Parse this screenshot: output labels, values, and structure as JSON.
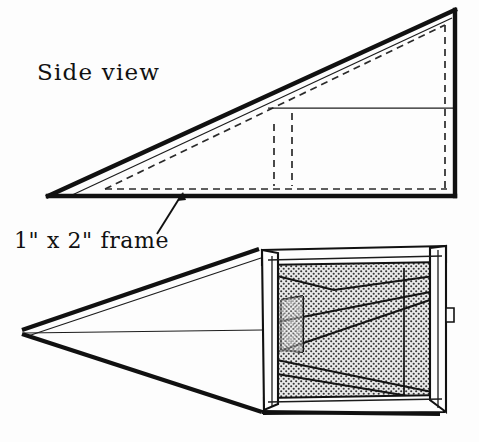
{
  "document": {
    "kind": "technical-line-drawing",
    "medium": "scanned hand-lettered ink drawing",
    "background_color": "#fdfdfd",
    "ink_color": "#111111",
    "subject": "Wedge-shaped screened frame box shown in side view and perspective view"
  },
  "labels": {
    "side_view": "Side view",
    "frame_callout": "1\" x 2\" frame"
  },
  "colors": {
    "paper": "#fdfdfd",
    "ink": "#111111",
    "ink_light": "#2a2a2a",
    "hidden_line": "#2b2b2b",
    "mesh_dot": "#3a3a3a",
    "mesh_fill": "#e8e8e8"
  },
  "views": {
    "side_view": {
      "name": "Side view",
      "description": "Right triangle profile with thick outer rule, thin inner parallel rule, dashed hidden interior frame members, and a horizontal shelf line at mid-height",
      "apex_left": [
        48,
        196
      ],
      "apex_top_right": [
        455,
        10
      ],
      "corner_bottom_right": [
        455,
        196
      ],
      "has_hidden_dashed_lines": true,
      "has_mid_horizontal_line": true
    },
    "perspective_view": {
      "name": "Perspective view",
      "description": "Wedge box receding to a sharp point at left, open screened end at right filled with stippled mesh and internal 1x2 frame members",
      "apex_left": [
        22,
        333
      ],
      "opening_top_left": [
        258,
        250
      ],
      "opening_bottom_right": [
        447,
        412
      ],
      "mesh_texture": "stipple-dot screen",
      "has_internal_frame_members": true
    }
  },
  "callout": {
    "text": "1\" x 2\" frame",
    "leader_from": [
      158,
      233
    ],
    "leader_to": [
      183,
      193
    ],
    "points_at": "hidden dashed frame member in side view"
  }
}
